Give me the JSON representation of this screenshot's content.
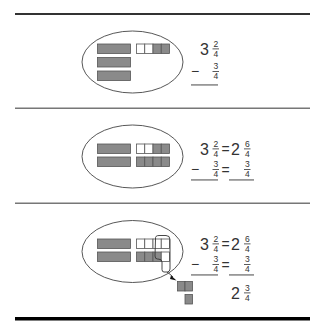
{
  "colors": {
    "ink": "#333333",
    "shade": "#8a8a8a",
    "shade_border": "#555555",
    "unshaded": "#ffffff",
    "rule_top": "#333333",
    "rule_mid": "#777777",
    "rule_bottom": "#000000"
  },
  "panels": [
    {
      "step": 1,
      "model": {
        "whole_bars": 3,
        "fraction_pieces": {
          "total": 4,
          "shaded": 2
        }
      },
      "equation": {
        "minuend": {
          "whole": "3",
          "num": "2",
          "den": "4"
        },
        "minus_sign": "−",
        "subtrahend": {
          "num": "3",
          "den": "4"
        }
      }
    },
    {
      "step": 2,
      "model": {
        "whole_bars": 2,
        "fraction_rows": [
          {
            "total": 4,
            "shaded": 2
          },
          {
            "total": 4,
            "shaded": 4
          }
        ]
      },
      "equation": {
        "minuend": {
          "whole": "3",
          "num": "2",
          "den": "4"
        },
        "equals": "=",
        "regrouped": {
          "whole": "2",
          "num": "6",
          "den": "4"
        },
        "minus_sign": "−",
        "subtrahend": {
          "num": "3",
          "den": "4"
        },
        "equals2": "=",
        "subtrahend_right": {
          "num": "3",
          "den": "4"
        }
      }
    },
    {
      "step": 3,
      "model": {
        "whole_bars": 2,
        "fraction_rows": [
          {
            "total": 4,
            "shaded": 0
          },
          {
            "total": 4,
            "shaded": 3
          }
        ],
        "removed_pieces": 3
      },
      "equation": {
        "minuend": {
          "whole": "3",
          "num": "2",
          "den": "4"
        },
        "equals": "=",
        "regrouped": {
          "whole": "2",
          "num": "6",
          "den": "4"
        },
        "minus_sign": "−",
        "subtrahend": {
          "num": "3",
          "den": "4"
        },
        "equals2": "=",
        "subtrahend_right": {
          "num": "3",
          "den": "4"
        },
        "result": {
          "whole": "2",
          "num": "3",
          "den": "4"
        }
      }
    }
  ]
}
